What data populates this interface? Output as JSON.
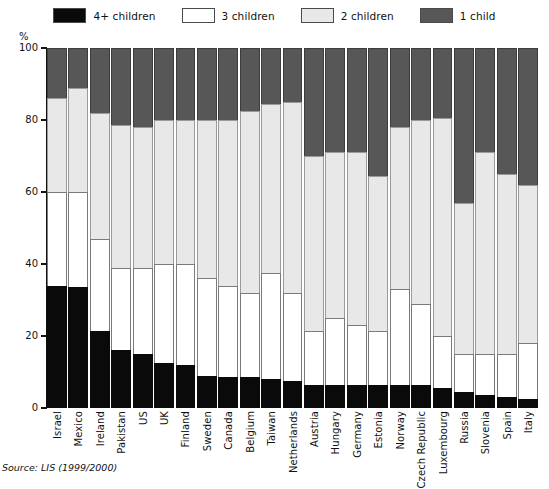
{
  "legend": {
    "items": [
      {
        "label": "4+ children",
        "color": "#0a0a0a",
        "key": "four_plus"
      },
      {
        "label": "3 children",
        "color": "#ffffff",
        "key": "three"
      },
      {
        "label": "2 children",
        "color": "#e8e8e8",
        "key": "two"
      },
      {
        "label": "1 child",
        "color": "#575757",
        "key": "one"
      }
    ]
  },
  "axis": {
    "unit_label": "%",
    "yticks": [
      "100",
      "80",
      "60",
      "40",
      "20",
      "0"
    ]
  },
  "source": "Source: LIS (1999/2000)",
  "chart_data": {
    "type": "bar",
    "subtype": "stacked-bar-100",
    "title": "",
    "subtitle": "",
    "xlabel": "",
    "ylabel": "%",
    "ylim": [
      0,
      100
    ],
    "yticks": [
      0,
      20,
      40,
      60,
      80,
      100
    ],
    "grid": false,
    "legend_position": "top-center",
    "stack_order_bottom_to_top": [
      "4+ children",
      "3 children",
      "2 children",
      "1 child"
    ],
    "categories": [
      "Israel",
      "Mexico",
      "Ireland",
      "Pakistan",
      "US",
      "UK",
      "Finland",
      "Sweden",
      "Canada",
      "Belgium",
      "Taiwan",
      "Netherlands",
      "Austria",
      "Hungary",
      "Germany",
      "Estonia",
      "Norway",
      "Czech Republic",
      "Luxembourg",
      "Russia",
      "Slovenia",
      "Spain",
      "Italy"
    ],
    "series": [
      {
        "name": "4+ children",
        "color": "#0a0a0a",
        "values": [
          34,
          33.5,
          21.5,
          16,
          15,
          12.5,
          12,
          9,
          8.5,
          8.5,
          8,
          7.5,
          6.5,
          6.5,
          6.5,
          6.5,
          6.5,
          6.5,
          5.5,
          4.5,
          3.5,
          3,
          2.5
        ]
      },
      {
        "name": "3 children",
        "color": "#ffffff",
        "values": [
          26,
          26.5,
          25.5,
          23,
          24,
          27.5,
          28,
          27,
          25.5,
          23.5,
          29.5,
          24.5,
          15,
          18.5,
          16.5,
          15,
          26.5,
          22.5,
          14.5,
          10.5,
          11.5,
          12,
          15.5
        ]
      },
      {
        "name": "2 children",
        "color": "#e8e8e8",
        "values": [
          26,
          29,
          35,
          39.5,
          39,
          40,
          40,
          44,
          46,
          50.5,
          47,
          53,
          48.5,
          46,
          48,
          43,
          45,
          51,
          60.5,
          42,
          56,
          50,
          44
        ]
      },
      {
        "name": "1 child",
        "color": "#575757",
        "values": [
          14,
          11,
          18,
          21.5,
          22,
          20,
          20,
          20,
          20,
          17.5,
          15.5,
          15,
          30,
          29,
          29,
          35.5,
          22,
          20,
          19.5,
          43,
          29,
          35,
          38
        ]
      }
    ]
  }
}
